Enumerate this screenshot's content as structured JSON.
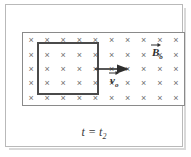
{
  "figure": {
    "caption": "t = t",
    "caption_subscript": "2",
    "field": {
      "symbol": "×",
      "columns": 10,
      "rows": 5,
      "direction": "into-page",
      "color": "#6e6e6e"
    },
    "loop": {
      "name": "conducting-loop",
      "color": "#4a4a4a"
    },
    "labels": {
      "magnetic_field": {
        "symbol": "B",
        "subscript": "o",
        "name": "magnetic-field-label"
      },
      "velocity": {
        "symbol": "v",
        "subscript": "o",
        "name": "velocity-label"
      }
    },
    "arrow": {
      "name": "velocity-arrow",
      "direction": "right",
      "color": "#2e2e2e"
    },
    "colors": {
      "frame": "#b9b9b9",
      "field_border": "#8a8a8a",
      "loop": "#4a4a4a",
      "text": "#2e2e2e",
      "background": "#ffffff"
    }
  }
}
